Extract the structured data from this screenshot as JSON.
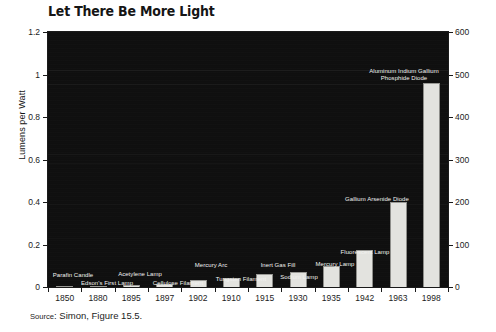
{
  "chart_data": {
    "type": "bar",
    "title": "Let There Be More Light",
    "xlabel": "",
    "ylabel": "Lumens per Watt",
    "categories": [
      "1850",
      "1880",
      "1895",
      "1897",
      "1902",
      "1910",
      "1915",
      "1930",
      "1935",
      "1942",
      "1963",
      "1998"
    ],
    "values": [
      0.004,
      0.006,
      0.01,
      0.016,
      0.034,
      0.044,
      0.06,
      0.07,
      0.1,
      0.175,
      0.4,
      0.96
    ],
    "values_right_axis": [
      2,
      3,
      5,
      8,
      17,
      22,
      30,
      35,
      50,
      87,
      200,
      480
    ],
    "point_labels": [
      "Parafin Candle",
      "Edson's First Lamp",
      "Acetylene Lamp",
      "Cellulose Filament",
      "Mercury Arc",
      "Tungsten Filament",
      "Inert Gas Fill",
      "Sodium Lamp",
      "Mercury Lamp",
      "Fluorescent Lamp",
      "Gallium Arsenide Diode",
      "Aluminum Indium Gallium Phosphide Diode"
    ],
    "ylim": [
      0,
      1.2
    ],
    "yticks": [
      "0",
      "0.2",
      "0.4",
      "0.6",
      "0.8",
      "1",
      "1.2"
    ],
    "ylim_right": [
      0,
      600
    ],
    "yticks_right": [
      "0",
      "100",
      "200",
      "300",
      "400",
      "500",
      "600"
    ],
    "grid": false,
    "legend": "none",
    "plot_background_color": "#0e0e0e",
    "bar_color": "#e3e3df"
  },
  "source": {
    "prefix": "Source",
    "text": ": Simon, Figure 15.5."
  },
  "annotations": [
    {
      "text": "Parafin Candle",
      "x": 73,
      "y": 272
    },
    {
      "text": "Edson's First Lamp",
      "x": 107,
      "y": 280
    },
    {
      "text": "Acetylene Lamp",
      "x": 140,
      "y": 271
    },
    {
      "text": "Cellulose Filament",
      "x": 178,
      "y": 280
    },
    {
      "text": "Mercury Arc",
      "x": 211,
      "y": 262
    },
    {
      "text": "Tungsten Filament",
      "x": 241,
      "y": 276
    },
    {
      "text": "Inert Gas Fill",
      "x": 278,
      "y": 262
    },
    {
      "text": "Sodium Lamp",
      "x": 299,
      "y": 274
    },
    {
      "text": "Mercury Lamp",
      "x": 335,
      "y": 261
    },
    {
      "text": "Fluorescent Lamp",
      "x": 365,
      "y": 249
    },
    {
      "text": "Gallium Arsenide Diode",
      "x": 377,
      "y": 196
    },
    {
      "text": "Aluminum Indium Gallium Phosphide Diode",
      "x": 404,
      "y": 68
    }
  ]
}
